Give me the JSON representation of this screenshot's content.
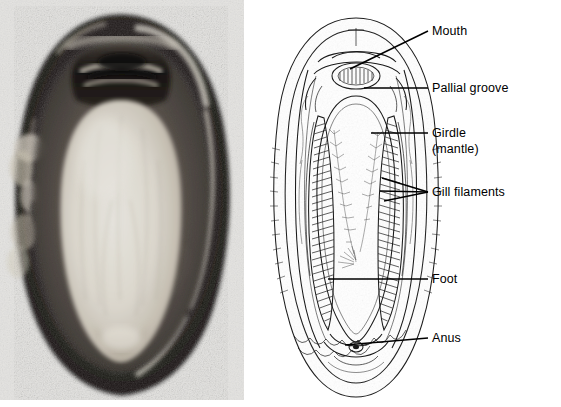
{
  "figure": {
    "kind": "two-panel-biology-figure",
    "background_color": "#ffffff",
    "panels": [
      {
        "id": "photograph",
        "type": "halftone-photograph",
        "position": "left"
      },
      {
        "id": "line-diagram",
        "type": "labeled-line-drawing",
        "position": "right"
      }
    ]
  },
  "photograph": {
    "name": "chiton-ventral-photograph",
    "frame": {
      "x": 0,
      "y": 0,
      "width": 244,
      "height": 400
    },
    "paper_tone": "#efeeec",
    "tones": {
      "girdle_dark": "#201d1b",
      "girdle_mid": "#4a443f",
      "pallial_shadow": "#6d6560",
      "foot_pale": "#e6e2da",
      "foot_shadow": "#cfc8bd",
      "highlight": "#f4f2ec",
      "mouth_dark": "#15120f"
    },
    "regions": [
      {
        "label": "girdle ring",
        "tone": "dark"
      },
      {
        "label": "pallial groove",
        "tone": "mid"
      },
      {
        "label": "foot",
        "tone": "pale"
      },
      {
        "label": "mouth",
        "tone": "darkest"
      }
    ]
  },
  "diagram": {
    "name": "chiton-ventral-diagram",
    "frame": {
      "x": 244,
      "y": 0,
      "width": 317,
      "height": 407
    },
    "line_color": "#1a1a1a",
    "fill_color": "#ffffff",
    "outline": {
      "top_y": 18,
      "bottom_y": 397,
      "left_x": 41,
      "right_x": 192,
      "center_x": 112
    }
  },
  "labels": [
    {
      "id": "mouth",
      "text": "Mouth",
      "text_x": 188,
      "text_y": 35,
      "anchor": "start",
      "leaders": [
        {
          "x1": 184,
          "y1": 31,
          "x2": 106,
          "y2": 69
        }
      ]
    },
    {
      "id": "pallial-groove",
      "text": "Pallial groove",
      "text_x": 188,
      "text_y": 92,
      "anchor": "start",
      "leaders": [
        {
          "x1": 184,
          "y1": 88,
          "x2": 120,
          "y2": 88
        }
      ]
    },
    {
      "id": "girdle-mantle",
      "text": "Girdle",
      "text_x": 188,
      "text_y": 137,
      "anchor": "start",
      "subtext": "(mantle)",
      "subtext_x": 188,
      "subtext_y": 153,
      "leaders": [
        {
          "x1": 184,
          "y1": 133,
          "x2": 127,
          "y2": 133
        }
      ]
    },
    {
      "id": "gill-filaments",
      "text": "Gill filaments",
      "text_x": 188,
      "text_y": 196,
      "anchor": "start",
      "leaders": [
        {
          "x1": 184,
          "y1": 192,
          "x2": 138,
          "y2": 178
        },
        {
          "x1": 184,
          "y1": 192,
          "x2": 136,
          "y2": 191
        },
        {
          "x1": 184,
          "y1": 192,
          "x2": 140,
          "y2": 201
        }
      ]
    },
    {
      "id": "foot",
      "text": "Foot",
      "text_x": 188,
      "text_y": 283,
      "anchor": "start",
      "leaders": [
        {
          "x1": 184,
          "y1": 279,
          "x2": 84,
          "y2": 279
        }
      ]
    },
    {
      "id": "anus",
      "text": "Anus",
      "text_x": 188,
      "text_y": 342,
      "anchor": "start",
      "leaders": [
        {
          "x1": 184,
          "y1": 338,
          "x2": 101,
          "y2": 345
        }
      ]
    }
  ]
}
